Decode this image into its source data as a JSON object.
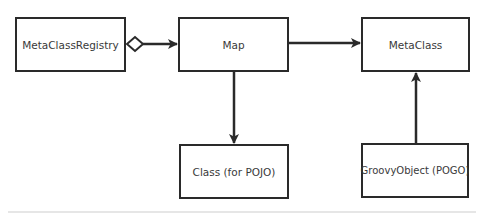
{
  "diagram": {
    "type": "class-diagram",
    "nodes": [
      {
        "id": "registry",
        "label": "MetaClassRegistry"
      },
      {
        "id": "map",
        "label": "Map"
      },
      {
        "id": "metaclass",
        "label": "MetaClass"
      },
      {
        "id": "pojo",
        "label": "Class (for POJO)"
      },
      {
        "id": "pogo",
        "label": "GroovyObject (POGO)"
      }
    ],
    "edges": [
      {
        "from": "registry",
        "to": "map",
        "kind": "aggregation-directed"
      },
      {
        "from": "map",
        "to": "metaclass",
        "kind": "association-arrow"
      },
      {
        "from": "map",
        "to": "pojo",
        "kind": "association-arrow"
      },
      {
        "from": "pogo",
        "to": "metaclass",
        "kind": "association-arrow"
      }
    ],
    "colors": {
      "stroke": "#2a2a2a",
      "text": "#3a3a3a",
      "background": "#ffffff"
    }
  }
}
